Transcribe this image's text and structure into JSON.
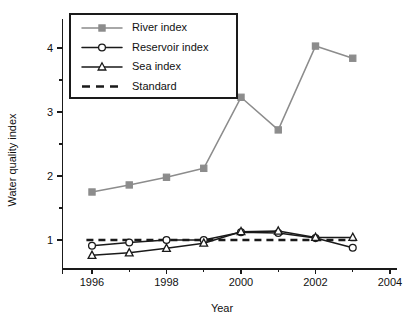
{
  "chart_data": {
    "type": "line",
    "title": "",
    "xlabel": "Year",
    "ylabel": "Water quality index",
    "x": [
      1996,
      1997,
      1998,
      1999,
      2000,
      2001,
      2002,
      2003
    ],
    "xlim": [
      1995.2,
      2004.2
    ],
    "ylim": [
      0.55,
      4.45
    ],
    "xticks": [
      1996,
      1998,
      2000,
      2002,
      2004
    ],
    "xtick_labels": [
      "1996",
      "1998",
      "2000",
      "2002",
      "2004"
    ],
    "xticks_minor": [
      1997,
      1999,
      2001,
      2003
    ],
    "yticks": [
      1,
      2,
      3,
      4
    ],
    "ytick_labels": [
      "1",
      "2",
      "3",
      "4"
    ],
    "yticks_minor": [
      1.5,
      2.5,
      3.5
    ],
    "grid": false,
    "legend_position": "upper left",
    "series": [
      {
        "name": "River index",
        "color": "#8c8c8c",
        "marker": "filled-square",
        "values": [
          1.75,
          1.86,
          1.98,
          2.12,
          3.23,
          2.72,
          4.03,
          3.84
        ]
      },
      {
        "name": "Reservoir index",
        "color": "#1a1a1a",
        "marker": "open-circle",
        "values": [
          0.91,
          0.96,
          1.0,
          1.0,
          1.12,
          1.11,
          1.03,
          0.88
        ]
      },
      {
        "name": "Sea index",
        "color": "#1a1a1a",
        "marker": "open-triangle",
        "values": [
          0.76,
          0.8,
          0.87,
          0.95,
          1.13,
          1.14,
          1.04,
          1.04
        ]
      }
    ],
    "reference_line": {
      "name": "Standard",
      "color": "#1a1a1a",
      "style": "dashed",
      "value": 1.0
    },
    "legend_entries": [
      {
        "label": "River index",
        "color": "#8c8c8c",
        "marker": "filled-square",
        "style": "solid"
      },
      {
        "label": "Reservoir index",
        "color": "#1a1a1a",
        "marker": "open-circle",
        "style": "solid"
      },
      {
        "label": "Sea index",
        "color": "#1a1a1a",
        "marker": "open-triangle",
        "style": "solid"
      },
      {
        "label": "Standard",
        "color": "#1a1a1a",
        "marker": "none",
        "style": "dashed"
      }
    ]
  }
}
